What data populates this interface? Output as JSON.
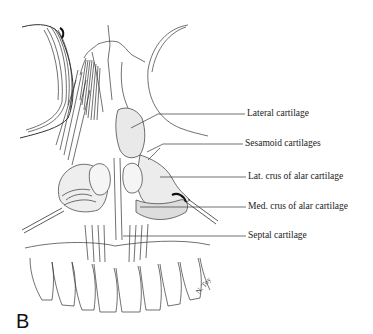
{
  "figure": {
    "panel_letter": "B",
    "signature": "N. Toy",
    "labels": [
      {
        "id": "lateral",
        "text": "Lateral cartilage"
      },
      {
        "id": "sesamoid",
        "text": "Sesamoid cartilages"
      },
      {
        "id": "lat-crus",
        "text": "Lat. crus of alar cartilage"
      },
      {
        "id": "med-crus",
        "text": "Med. crus of alar cartilage"
      },
      {
        "id": "septal",
        "text": "Septal cartilage"
      }
    ]
  }
}
